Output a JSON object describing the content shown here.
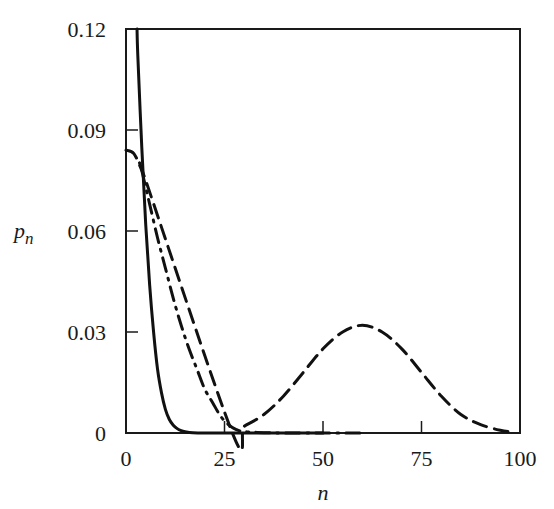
{
  "chart_data": {
    "type": "line",
    "title": "",
    "xlabel": "n",
    "ylabel": "p",
    "ylabel_subscript": "n",
    "xlim": [
      0,
      100
    ],
    "ylim": [
      0,
      0.12
    ],
    "grid": false,
    "legend": null,
    "x_ticks": [
      0,
      25,
      50,
      75,
      100
    ],
    "x_tick_labels": [
      "0",
      "25",
      "50",
      "75",
      "100"
    ],
    "y_ticks": [
      0,
      0.03,
      0.06,
      0.09,
      0.12
    ],
    "y_tick_labels": [
      "0",
      "0.03",
      "0.06",
      "0.09",
      "0.12"
    ],
    "series": [
      {
        "name": "solid",
        "style": "solid",
        "x": [
          2.8,
          3,
          4,
          5,
          6,
          7,
          8,
          9,
          10,
          11,
          12,
          13,
          14,
          15,
          17,
          20,
          25,
          30,
          40,
          50
        ],
        "values": [
          0.12,
          0.112,
          0.085,
          0.062,
          0.044,
          0.03,
          0.019,
          0.012,
          0.007,
          0.004,
          0.0023,
          0.0013,
          0.0007,
          0.0004,
          0.0001,
          0.0,
          0.0,
          0.0,
          0.0,
          0.0
        ]
      },
      {
        "name": "dash-dot",
        "style": "dashdot",
        "x": [
          4,
          5,
          6,
          8,
          10,
          12,
          14,
          16,
          18,
          20,
          22,
          24,
          26,
          28,
          30,
          35,
          40,
          50,
          60
        ],
        "values": [
          0.078,
          0.073,
          0.068,
          0.058,
          0.049,
          0.04,
          0.032,
          0.025,
          0.019,
          0.013,
          0.009,
          0.005,
          0.0025,
          0.001,
          0.0004,
          0.0001,
          0.0,
          0.0,
          0.0
        ]
      },
      {
        "name": "dashed",
        "style": "dashed",
        "x": [
          0,
          2,
          4,
          5,
          27,
          30,
          35,
          40,
          45,
          50,
          55,
          60,
          65,
          70,
          75,
          80,
          85,
          90,
          95,
          98
        ],
        "values": [
          0.084,
          0.083,
          0.078,
          0.075,
          0.0,
          0.002,
          0.0055,
          0.011,
          0.018,
          0.025,
          0.03,
          0.032,
          0.03,
          0.025,
          0.018,
          0.011,
          0.0055,
          0.0025,
          0.0008,
          0.0003
        ]
      }
    ]
  }
}
